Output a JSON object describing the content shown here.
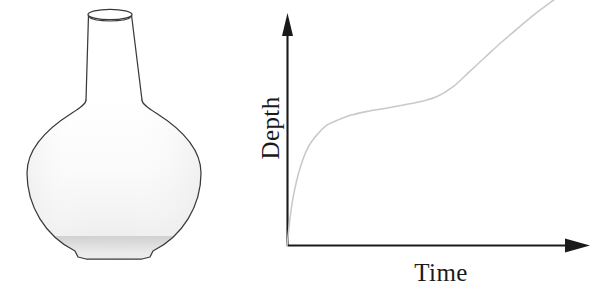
{
  "figure": {
    "width": 603,
    "height": 290,
    "background": "#ffffff",
    "panels": [
      "flask-diagram",
      "depth-time-graph"
    ]
  },
  "flask": {
    "name": "round-bottom-flask",
    "description": "Round bottom flask with narrow cylindrical neck",
    "outline_color": "#3a3a3a",
    "body_fill_top": "#ffffff",
    "body_fill_bottom": "#e8e8e8",
    "liquid_band_color": "#d4d4d4",
    "neck_fill": "#ffffff",
    "rim_label": "neck-opening",
    "parts": [
      "neck-opening-ellipse",
      "neck-tube",
      "bulb-body",
      "flat-bottom",
      "liquid-shading"
    ],
    "geometry": {
      "rim_center_x": 110,
      "rim_center_y": 14,
      "rim_rx": 22,
      "rim_ry": 5,
      "neck_top_y": 14,
      "neck_shoulder_y": 100,
      "bulb_center_x": 114,
      "bulb_center_y": 172,
      "bulb_radius": 87,
      "bottom_flat_y": 259
    }
  },
  "chart_data": {
    "type": "line",
    "title": "",
    "xlabel": "Time",
    "ylabel": "Depth",
    "grid": false,
    "legend": null,
    "axis_arrows": true,
    "xlim": [
      0,
      1
    ],
    "ylim": [
      0,
      1
    ],
    "x_tick_labels": [],
    "y_tick_labels": [],
    "series": [
      {
        "name": "depth-over-time",
        "color": "#c9c9c9",
        "annotation": "Steep initial rise (narrow base), long plateau (wide bulb), then steep rise again (narrow neck)",
        "x": [
          0.0,
          0.01,
          0.02,
          0.035,
          0.05,
          0.07,
          0.09,
          0.12,
          0.15,
          0.19,
          0.24,
          0.3,
          0.37,
          0.44,
          0.5,
          0.56,
          0.62,
          0.68,
          0.74,
          0.8,
          0.86,
          0.92,
          1.0
        ],
        "y": [
          0.0,
          0.1,
          0.18,
          0.26,
          0.32,
          0.38,
          0.42,
          0.46,
          0.49,
          0.51,
          0.53,
          0.545,
          0.558,
          0.572,
          0.585,
          0.605,
          0.645,
          0.705,
          0.765,
          0.825,
          0.88,
          0.935,
          1.0
        ]
      }
    ],
    "axes": {
      "origin_px": [
        287,
        246
      ],
      "y_axis_top_px": [
        287,
        18
      ],
      "x_axis_right_px": [
        588,
        246
      ],
      "axis_color": "#1a1a1a"
    }
  },
  "labels": {
    "y_axis": "Depth",
    "x_axis": "Time"
  }
}
